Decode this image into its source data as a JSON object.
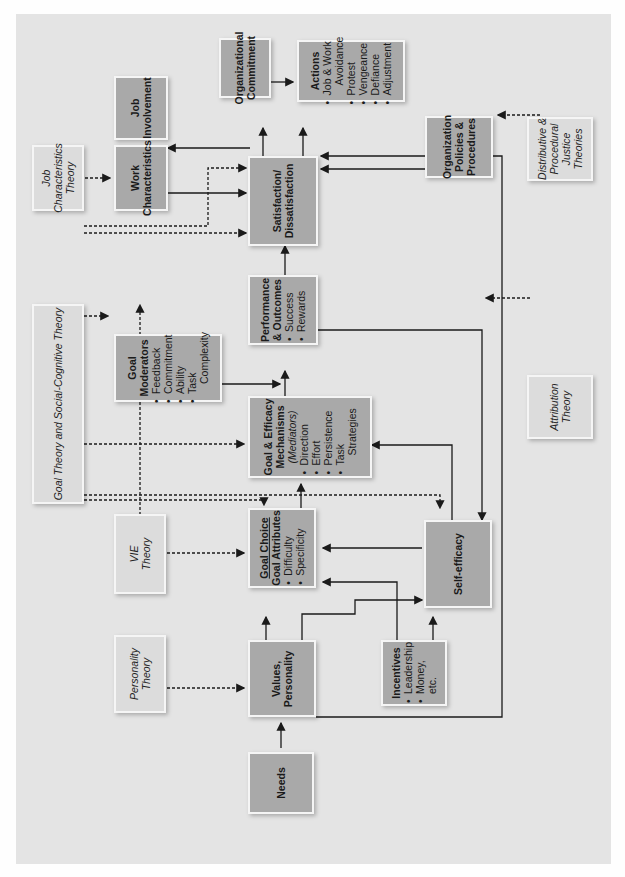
{
  "diagram": {
    "nodes": {
      "needs": {
        "title": "Needs"
      },
      "values": {
        "title": "Values,",
        "title2": "Personality"
      },
      "personality_theory": {
        "line1": "Personality",
        "line2": "Theory"
      },
      "incentives": {
        "title": "Incentives",
        "items": [
          "Leadership",
          "Money,"
        ],
        "extra": "etc."
      },
      "goal_choice": {
        "title": "Goal Choice",
        "subtitle": "Goal Attributes",
        "items": [
          "Difficulty",
          "Specificity"
        ]
      },
      "vie_theory": {
        "line1": "VIE",
        "line2": "Theory"
      },
      "self_efficacy": {
        "title": "Self-efficacy"
      },
      "goal_efficacy": {
        "title": "Goal & Efficacy",
        "title2": "Mechanisms",
        "subtitle": "(Mediators)",
        "items": [
          "Direction",
          "Effort",
          "Persistence",
          "Task"
        ],
        "extra": "Strategies"
      },
      "goal_theory": {
        "line1": "Goal Theory and Social-Cognitive Theory"
      },
      "goal_moderators": {
        "title": "Goal",
        "title2": "Moderators",
        "items": [
          "Feedback",
          "Commitment",
          "Ability",
          "Task"
        ],
        "extra": "Complexity"
      },
      "performance": {
        "title": "Performance",
        "title2": "& Outcomes",
        "items": [
          "Success",
          "Rewards"
        ]
      },
      "job_char_theory": {
        "line1": "Job",
        "line2": "Characteristics",
        "line3": "Theory"
      },
      "work_char": {
        "title": "Work",
        "title2": "Characteristics"
      },
      "satisfaction": {
        "title": "Satisfaction/",
        "title2": "Dissatisfaction"
      },
      "job_involvement": {
        "title": "Job",
        "title2": "Involvement"
      },
      "org_commitment": {
        "title": "Organizational",
        "title2": "Commitment"
      },
      "actions": {
        "title": "Actions",
        "items": [
          "Job & Work"
        ],
        "mid": "Avoidance",
        "items2": [
          "Protest",
          "Vengeance",
          "Defiance",
          "Adjustment"
        ]
      },
      "org_policies": {
        "title": "Organization",
        "title2": "Policies &",
        "title3": "Procedures"
      },
      "justice_theories": {
        "line1": "Distributive &",
        "line2": "Procedural",
        "line3": "Justice",
        "line4": "Theories"
      },
      "attribution_theory": {
        "line1": "Attribution",
        "line2": "Theory"
      }
    },
    "colors": {
      "panel": "#e4e4e4",
      "box": "#a9a9a9",
      "theory_box": "#dcdcdc",
      "line": "#1a1a1a"
    }
  }
}
